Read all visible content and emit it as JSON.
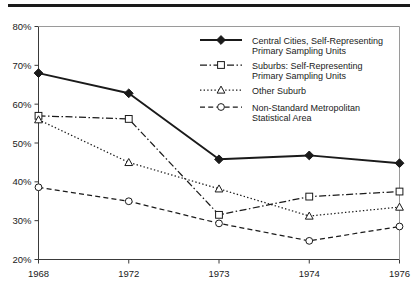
{
  "chart_data": {
    "type": "line",
    "title": "",
    "subtitle": "",
    "xlabel": "",
    "ylabel": "",
    "categories": [
      "1968",
      "1972",
      "1973",
      "1974",
      "1976"
    ],
    "ylim": [
      20,
      80
    ],
    "ytick_labels": [
      "20%",
      "30%",
      "40%",
      "50%",
      "60%",
      "70%",
      "80%"
    ],
    "ytick_values": [
      20,
      30,
      40,
      50,
      60,
      70,
      80
    ],
    "grid": false,
    "legend_position": "upper-right-inside",
    "series": [
      {
        "name": "Central Cities, Self-Representing Primary Sampling Units",
        "marker": "filled-diamond",
        "linestyle": "solid",
        "color": "#1a1a1a",
        "values": [
          68.0,
          62.8,
          45.8,
          46.8,
          44.8
        ]
      },
      {
        "name": "Suburbs: Self-Representing Primary Sampling Units",
        "marker": "open-square",
        "linestyle": "dash-dot",
        "color": "#1a1a1a",
        "values": [
          57.0,
          56.2,
          31.5,
          36.2,
          37.5
        ]
      },
      {
        "name": "Other Suburb",
        "marker": "open-triangle",
        "linestyle": "dotted",
        "color": "#1a1a1a",
        "values": [
          56.0,
          45.0,
          38.2,
          31.2,
          33.5
        ]
      },
      {
        "name": "Non-Standard Metropolitan Statistical Area",
        "marker": "open-circle",
        "linestyle": "dashed",
        "color": "#1a1a1a",
        "values": [
          38.6,
          35.0,
          29.3,
          24.8,
          28.5
        ]
      }
    ]
  },
  "legend": {
    "entries": [
      {
        "line1": "Central Cities, Self-Representing",
        "line2": "Primary Sampling Units"
      },
      {
        "line1": "Suburbs: Self-Representing",
        "line2": "Primary Sampling Units"
      },
      {
        "line1": "Other Suburb",
        "line2": ""
      },
      {
        "line1": "Non-Standard Metropolitan",
        "line2": "Statistical Area"
      }
    ]
  }
}
